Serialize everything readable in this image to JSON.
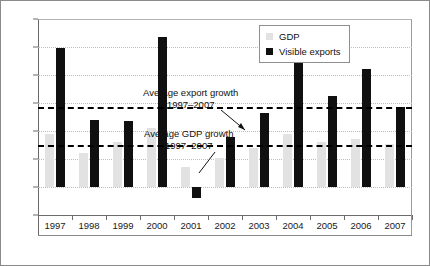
{
  "chart_data": {
    "type": "bar",
    "title": "",
    "xlabel": "",
    "ylabel": "",
    "ylim": [
      -2,
      12
    ],
    "yticks": [
      -2,
      0,
      2,
      4,
      6,
      8,
      10,
      12
    ],
    "ytick_labels": [
      "-2",
      "0",
      "2",
      "4",
      "6",
      "8",
      "10",
      "12"
    ],
    "grid": true,
    "legend_position": "top-right",
    "categories": [
      "1997",
      "1998",
      "1999",
      "2000",
      "2001",
      "2002",
      "2003",
      "2004",
      "2005",
      "2006",
      "2007"
    ],
    "series": [
      {
        "name": "GDP",
        "color": "#e2e2e2",
        "values": [
          3.8,
          2.4,
          3.2,
          4.2,
          1.4,
          2.1,
          2.8,
          3.8,
          3.2,
          3.4,
          3.1
        ]
      },
      {
        "name": "Visible exports",
        "color": "#101010",
        "values": [
          9.9,
          4.8,
          4.7,
          10.7,
          -0.8,
          3.6,
          5.3,
          9.8,
          6.5,
          8.4,
          5.7
        ]
      }
    ],
    "reference_lines": [
      {
        "name": "average-export-growth",
        "value": 5.7,
        "style": "dashed",
        "color": "#000000",
        "label": "Average export  growth",
        "label_line2": "1997–2007"
      },
      {
        "name": "average-gdp-growth",
        "value": 3.0,
        "style": "dashed",
        "color": "#000000",
        "label": "Average GDP growth",
        "label_line2": "1997–2007"
      }
    ],
    "annotations": [
      {
        "text": "Average export  growth",
        "text2": "1997–2007"
      },
      {
        "text": "Average GDP growth",
        "text2": "1997–2007"
      }
    ]
  },
  "legend": {
    "items": [
      {
        "label": "GDP",
        "color": "#e2e2e2",
        "marker": "square-gray"
      },
      {
        "label": "Visible exports",
        "color": "#101010",
        "marker": "square-black"
      }
    ]
  }
}
